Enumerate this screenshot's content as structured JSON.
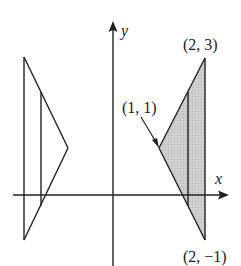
{
  "diagram": {
    "type": "solid-of-revolution",
    "axes": {
      "x_label": "x",
      "y_label": "y"
    },
    "points": [
      {
        "id": "p23",
        "label": "(2, 3)",
        "x": 2,
        "y": 3
      },
      {
        "id": "p11",
        "label": "(1, 1)",
        "x": 1,
        "y": 1
      },
      {
        "id": "p2m1",
        "label": "(2, −1)",
        "x": 2,
        "y": -1
      }
    ],
    "shaded_region": {
      "vertices": [
        [
          1,
          1
        ],
        [
          2,
          3
        ],
        [
          2,
          -1
        ]
      ],
      "fill": "#c8c8c8"
    },
    "reflected_region": {
      "description": "Mirror image of shaded triangle on left side (revolved)"
    },
    "colors": {
      "stroke": "#222222",
      "fill": "#c8c8c8",
      "background": "#ffffff"
    }
  }
}
